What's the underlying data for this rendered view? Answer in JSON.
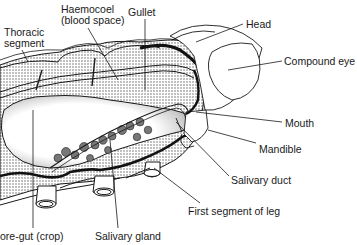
{
  "diagram": {
    "colors": {
      "ink": "#1a1a1a",
      "stipple": "#8a8a8a",
      "background": "#ffffff"
    },
    "labels": [
      {
        "id": "thoracic-segment",
        "text": "Thoracic\nsegment",
        "x": 4,
        "y": 27
      },
      {
        "id": "haemocoel",
        "text": "Haemocoel\n(blood space)",
        "x": 61,
        "y": 4
      },
      {
        "id": "gullet",
        "text": "Gullet",
        "x": 128,
        "y": 7
      },
      {
        "id": "head",
        "text": "Head",
        "x": 246,
        "y": 19
      },
      {
        "id": "compound-eye",
        "text": "Compound eye",
        "x": 284,
        "y": 56
      },
      {
        "id": "mouth",
        "text": "Mouth",
        "x": 285,
        "y": 118
      },
      {
        "id": "mandible",
        "text": "Mandible",
        "x": 259,
        "y": 144
      },
      {
        "id": "salivary-duct",
        "text": "Salivary duct",
        "x": 231,
        "y": 175
      },
      {
        "id": "first-segment-of-leg",
        "text": "First segment of leg",
        "x": 188,
        "y": 206
      },
      {
        "id": "fore-gut",
        "text": "ore-gut (crop)",
        "x": 0,
        "y": 231
      },
      {
        "id": "salivary-gland",
        "text": "Salivary gland",
        "x": 95,
        "y": 231
      }
    ]
  }
}
